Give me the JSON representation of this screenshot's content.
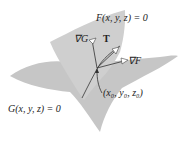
{
  "labels": {
    "surface_f": "F(x, y, z) = 0",
    "surface_g": "G(x, y, z) = 0",
    "grad_g": "∇G",
    "tangent": "T",
    "grad_f": "∇F",
    "point": "(x₀, y₀, z₀)"
  },
  "colors": {
    "surface": "#c9c9c9",
    "surface_edge": "#b0b0b0",
    "curve": "#555555",
    "vector": "#444444",
    "text": "#222222"
  }
}
